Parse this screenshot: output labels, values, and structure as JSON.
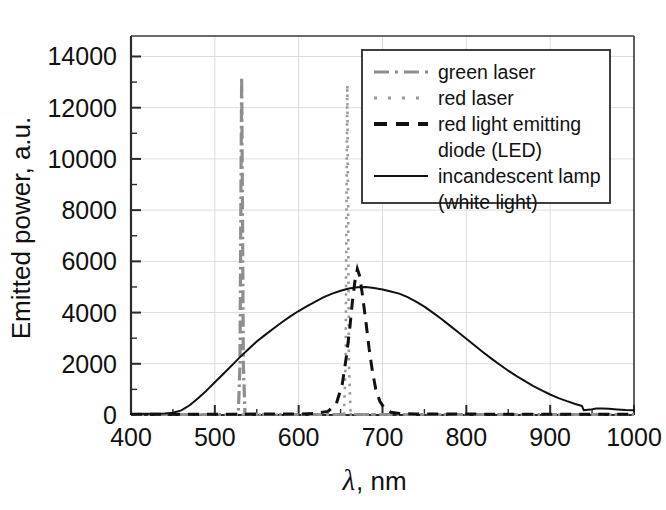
{
  "chart_data": {
    "type": "line",
    "title": "",
    "subtitle": "",
    "xlabel": "λ, nm",
    "xlabel_symbol": "λ",
    "xlabel_unit": ", nm",
    "ylabel": "Emitted power, a.u.",
    "xlim": [
      400,
      1000
    ],
    "ylim": [
      0,
      14800
    ],
    "xticks": [
      400,
      500,
      600,
      700,
      800,
      900,
      1000
    ],
    "xtick_labels": [
      "400",
      "500",
      "600",
      "700",
      "800",
      "900",
      "1000"
    ],
    "xtick_minor_step": 50,
    "yticks": [
      0,
      2000,
      4000,
      6000,
      8000,
      10000,
      12000,
      14000
    ],
    "ytick_labels": [
      "0",
      "2000",
      "4000",
      "6000",
      "8000",
      "10000",
      "12000",
      "14000"
    ],
    "ytick_minor_step": 1000,
    "grid": true,
    "grid_color": "#d8d8d8",
    "legend_position": "top-right",
    "axis_color": "#2b2b2b",
    "background": "#ffffff",
    "series": [
      {
        "name": "green laser",
        "style": "dash-dot",
        "color": "#8e8e8e",
        "peak_wavelength": 532,
        "peak_value": 13200,
        "fwhm_nm": 3,
        "points": [
          [
            400,
            20
          ],
          [
            520,
            20
          ],
          [
            528,
            30
          ],
          [
            530,
            2000
          ],
          [
            531,
            8000
          ],
          [
            532,
            13200
          ],
          [
            533,
            8000
          ],
          [
            534,
            2000
          ],
          [
            536,
            30
          ],
          [
            560,
            20
          ],
          [
            700,
            20
          ],
          [
            900,
            20
          ],
          [
            1000,
            20
          ]
        ]
      },
      {
        "name": "red laser",
        "style": "dotted",
        "color": "#9a9a9a",
        "peak_wavelength": 658,
        "peak_value": 12900,
        "fwhm_nm": 3,
        "points": [
          [
            400,
            20
          ],
          [
            600,
            20
          ],
          [
            654,
            30
          ],
          [
            656,
            2000
          ],
          [
            657,
            8000
          ],
          [
            658,
            12900
          ],
          [
            659,
            8000
          ],
          [
            660,
            2000
          ],
          [
            662,
            30
          ],
          [
            700,
            20
          ],
          [
            900,
            20
          ],
          [
            1000,
            20
          ]
        ]
      },
      {
        "name": "red light emitting diode (LED)",
        "name_line1": "red light emitting",
        "name_line2": "diode (LED)",
        "style": "dashed",
        "color": "#111111",
        "peak_wavelength": 670,
        "peak_value": 5700,
        "fwhm_nm": 26,
        "points": [
          [
            400,
            30
          ],
          [
            500,
            30
          ],
          [
            560,
            35
          ],
          [
            600,
            40
          ],
          [
            620,
            60
          ],
          [
            635,
            140
          ],
          [
            645,
            450
          ],
          [
            652,
            1200
          ],
          [
            657,
            2300
          ],
          [
            661,
            3400
          ],
          [
            664,
            4400
          ],
          [
            667,
            5200
          ],
          [
            670,
            5700
          ],
          [
            673,
            5400
          ],
          [
            676,
            4700
          ],
          [
            680,
            3700
          ],
          [
            684,
            2600
          ],
          [
            688,
            1700
          ],
          [
            692,
            1000
          ],
          [
            697,
            520
          ],
          [
            703,
            230
          ],
          [
            710,
            110
          ],
          [
            720,
            60
          ],
          [
            740,
            40
          ],
          [
            800,
            35
          ],
          [
            900,
            30
          ],
          [
            1000,
            30
          ]
        ]
      },
      {
        "name": "incandescent lamp (white light)",
        "name_line1": "incandescent lamp",
        "name_line2": "(white light)",
        "style": "solid",
        "color": "#111111",
        "peak_wavelength": 672,
        "peak_value": 5000,
        "points": [
          [
            400,
            40
          ],
          [
            420,
            45
          ],
          [
            440,
            60
          ],
          [
            450,
            90
          ],
          [
            460,
            180
          ],
          [
            470,
            380
          ],
          [
            480,
            650
          ],
          [
            490,
            950
          ],
          [
            500,
            1280
          ],
          [
            510,
            1600
          ],
          [
            520,
            1930
          ],
          [
            530,
            2260
          ],
          [
            540,
            2570
          ],
          [
            550,
            2870
          ],
          [
            560,
            3130
          ],
          [
            570,
            3380
          ],
          [
            580,
            3620
          ],
          [
            590,
            3850
          ],
          [
            600,
            4060
          ],
          [
            610,
            4250
          ],
          [
            620,
            4430
          ],
          [
            630,
            4600
          ],
          [
            640,
            4740
          ],
          [
            650,
            4850
          ],
          [
            660,
            4940
          ],
          [
            670,
            4990
          ],
          [
            680,
            5000
          ],
          [
            690,
            4960
          ],
          [
            700,
            4900
          ],
          [
            710,
            4820
          ],
          [
            720,
            4740
          ],
          [
            730,
            4600
          ],
          [
            740,
            4430
          ],
          [
            750,
            4230
          ],
          [
            760,
            4000
          ],
          [
            770,
            3760
          ],
          [
            780,
            3500
          ],
          [
            790,
            3240
          ],
          [
            800,
            2980
          ],
          [
            810,
            2710
          ],
          [
            820,
            2450
          ],
          [
            830,
            2200
          ],
          [
            840,
            1960
          ],
          [
            850,
            1730
          ],
          [
            860,
            1520
          ],
          [
            870,
            1320
          ],
          [
            880,
            1130
          ],
          [
            890,
            960
          ],
          [
            900,
            800
          ],
          [
            910,
            660
          ],
          [
            920,
            540
          ],
          [
            930,
            430
          ],
          [
            938,
            350
          ],
          [
            940,
            190
          ],
          [
            948,
            210
          ],
          [
            955,
            250
          ],
          [
            962,
            255
          ],
          [
            970,
            240
          ],
          [
            980,
            215
          ],
          [
            990,
            195
          ],
          [
            1000,
            190
          ]
        ]
      }
    ]
  },
  "legend": {
    "entries": [
      {
        "label": "green laser",
        "label2": "",
        "swatch": "dash-dot-swatch"
      },
      {
        "label": "red laser",
        "label2": "",
        "swatch": "dotted-swatch"
      },
      {
        "label": "red light emitting",
        "label2": "diode (LED)",
        "swatch": "dashed-swatch"
      },
      {
        "label": "incandescent lamp",
        "label2": "(white light)",
        "swatch": "solid-swatch"
      }
    ]
  }
}
